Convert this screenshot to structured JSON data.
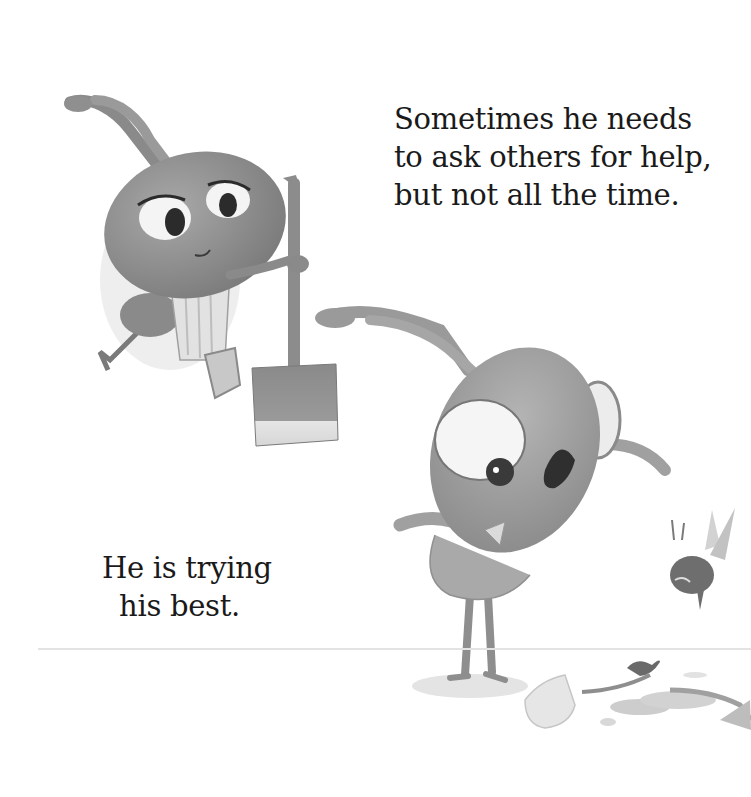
{
  "page": {
    "top_text": {
      "lines": [
        "Sometimes he needs",
        "to ask others for help,",
        "but not all the time."
      ]
    },
    "bottom_text": {
      "lines": [
        "He is trying",
        "his best."
      ]
    },
    "illustrations": {
      "character_left": "ant-with-broom",
      "character_center": "ant-looking-down",
      "character_small": "flying-bug",
      "ground_items": "broken-eggshell-and-leaves"
    },
    "colors": {
      "background": "#ffffff",
      "text": "#1a1a1a",
      "body_gray": "#8c8c8c",
      "dark_gray": "#5a5a5a",
      "light_gray": "#d0d0d0"
    }
  }
}
